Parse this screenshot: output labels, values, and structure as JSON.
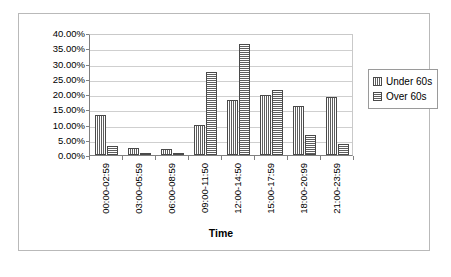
{
  "chart_data": {
    "type": "bar",
    "title": "",
    "xlabel": "Time",
    "ylabel": "",
    "ylim": [
      0,
      40
    ],
    "ytick_step": 5,
    "ytick_labels": [
      "0.00%",
      "5.00%",
      "10.00%",
      "15.00%",
      "20.00%",
      "25.00%",
      "30.00%",
      "35.00%",
      "40.00%"
    ],
    "grid": true,
    "legend_position": "right",
    "categories": [
      "00:00-02:59",
      "03:00-05:59",
      "06:00-08:59",
      "09:00-11:50",
      "12:00-14:50",
      "15:00-17:59",
      "18:00-20:99",
      "21:00-23:59"
    ],
    "series": [
      {
        "name": "Under 60s",
        "pattern": "vertical-stripes",
        "values": [
          13.0,
          2.3,
          1.9,
          9.7,
          18.1,
          19.7,
          16.0,
          19.0
        ]
      },
      {
        "name": "Over 60s",
        "pattern": "horizontal-stripes",
        "values": [
          2.9,
          0.3,
          0.8,
          27.2,
          36.3,
          21.2,
          6.7,
          3.6
        ]
      }
    ]
  },
  "legend": {
    "items": [
      {
        "label": "Under 60s"
      },
      {
        "label": "Over 60s"
      }
    ]
  },
  "axis": {
    "x_title": "Time"
  },
  "colors": {
    "bar_fill": "#8c8c8c",
    "bar_stroke": "#4a4a4a",
    "gridline": "#cfcfcf",
    "axis_line": "#808080",
    "frame": "#b9b9b9"
  }
}
